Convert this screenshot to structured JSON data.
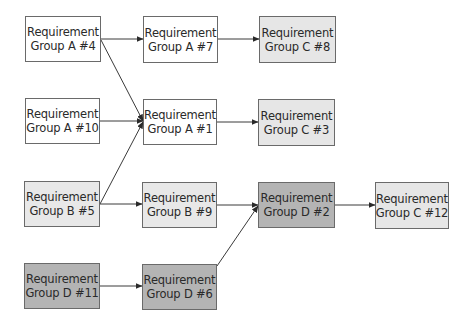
{
  "diagram": {
    "type": "flow",
    "colors": {
      "A": "#ffffff",
      "B": "#e8e8e8",
      "C": "#e6e6e6",
      "D": "#b4b4b4",
      "border": "#6a6a6a",
      "edge": "#3a3a3a"
    },
    "nodes": [
      {
        "id": "A4",
        "line1": "Requirement",
        "line2": "Group A #4",
        "group": "A",
        "x": 25,
        "y": 16,
        "w": 76,
        "h": 46
      },
      {
        "id": "A7",
        "line1": "Requirement",
        "line2": "Group A #7",
        "group": "A",
        "x": 143,
        "y": 16,
        "w": 75,
        "h": 47
      },
      {
        "id": "C8",
        "line1": "Requirement",
        "line2": "Group C #8",
        "group": "C",
        "x": 259,
        "y": 16,
        "w": 77,
        "h": 47
      },
      {
        "id": "A10",
        "line1": "Requirement",
        "line2": "Group A #10",
        "group": "A",
        "x": 25,
        "y": 98,
        "w": 75,
        "h": 46
      },
      {
        "id": "A1",
        "line1": "Requirement",
        "line2": "Group A #1",
        "group": "A",
        "x": 143,
        "y": 99,
        "w": 74,
        "h": 46
      },
      {
        "id": "C3",
        "line1": "Requirement",
        "line2": "Group C #3",
        "group": "C",
        "x": 258,
        "y": 99,
        "w": 77,
        "h": 47
      },
      {
        "id": "B5",
        "line1": "Requirement",
        "line2": "Group B #5",
        "group": "B",
        "x": 24,
        "y": 181,
        "w": 76,
        "h": 46
      },
      {
        "id": "B9",
        "line1": "Requirement",
        "line2": "Group B #9",
        "group": "B",
        "x": 142,
        "y": 182,
        "w": 75,
        "h": 46
      },
      {
        "id": "D2",
        "line1": "Requirement",
        "line2": "Group D #2",
        "group": "D",
        "x": 258,
        "y": 182,
        "w": 77,
        "h": 46
      },
      {
        "id": "C12",
        "line1": "Requirement",
        "line2": "Group C #12",
        "group": "C",
        "x": 375,
        "y": 182,
        "w": 74,
        "h": 47
      },
      {
        "id": "D11",
        "line1": "Requirement",
        "line2": "Group D #11",
        "group": "D",
        "x": 24,
        "y": 263,
        "w": 76,
        "h": 46
      },
      {
        "id": "D6",
        "line1": "Requirement",
        "line2": "Group D #6",
        "group": "D",
        "x": 142,
        "y": 264,
        "w": 75,
        "h": 46
      }
    ],
    "edges": [
      {
        "from": "A4",
        "to": "A7",
        "x1": 101,
        "y1": 39,
        "x2": 143,
        "y2": 39
      },
      {
        "from": "A4",
        "to": "A1",
        "x1": 101,
        "y1": 40,
        "x2": 143,
        "y2": 121
      },
      {
        "from": "A7",
        "to": "C8",
        "x1": 218,
        "y1": 39,
        "x2": 259,
        "y2": 39
      },
      {
        "from": "A10",
        "to": "A1",
        "x1": 100,
        "y1": 121,
        "x2": 143,
        "y2": 121
      },
      {
        "from": "B5",
        "to": "A1",
        "x1": 100,
        "y1": 204,
        "x2": 143,
        "y2": 122
      },
      {
        "from": "A1",
        "to": "C3",
        "x1": 217,
        "y1": 122,
        "x2": 258,
        "y2": 122
      },
      {
        "from": "B5",
        "to": "B9",
        "x1": 100,
        "y1": 204,
        "x2": 142,
        "y2": 204
      },
      {
        "from": "B9",
        "to": "D2",
        "x1": 217,
        "y1": 205,
        "x2": 258,
        "y2": 205
      },
      {
        "from": "D6",
        "to": "D2",
        "x1": 217,
        "y1": 266,
        "x2": 258,
        "y2": 206
      },
      {
        "from": "D2",
        "to": "C12",
        "x1": 335,
        "y1": 205,
        "x2": 375,
        "y2": 205
      },
      {
        "from": "D11",
        "to": "D6",
        "x1": 100,
        "y1": 286,
        "x2": 142,
        "y2": 286
      }
    ]
  }
}
